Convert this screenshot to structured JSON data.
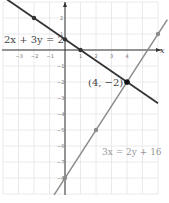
{
  "chart_data": {
    "type": "line",
    "title": "",
    "xlabel": "x",
    "ylabel": "y",
    "xlim": [
      -4,
      6
    ],
    "ylim": [
      -9,
      3
    ],
    "grid": true,
    "x_tick_labels": [
      "-3",
      "-2",
      "-1",
      "1",
      "2",
      "3",
      "4"
    ],
    "y_tick_labels": [
      "2",
      "1",
      "-1",
      "-2",
      "-3",
      "-4",
      "-5",
      "-6",
      "-7",
      "-8"
    ],
    "series": [
      {
        "name": "2x + 3y = 2",
        "color": "#333333",
        "points": [
          [
            -2,
            2
          ],
          [
            0,
            0.667
          ],
          [
            1,
            0
          ],
          [
            4,
            -2
          ]
        ],
        "line_extent": [
          [
            -4,
            3.333
          ],
          [
            6,
            -3.333
          ]
        ]
      },
      {
        "name": "3x = 2y + 16",
        "color": "#8c8c8c",
        "points": [
          [
            0,
            -8
          ],
          [
            2,
            -5
          ],
          [
            4,
            -2
          ],
          [
            6,
            1
          ]
        ],
        "line_extent": [
          [
            -0.7,
            -9.05
          ],
          [
            6.6,
            1.9
          ]
        ]
      }
    ],
    "annotations": [
      {
        "text": "2x + 3y = 2",
        "at": [
          -2.9,
          0.7
        ]
      },
      {
        "text": "(4, −2)",
        "at": [
          1.4,
          -2.1
        ]
      },
      {
        "text": "3x = 2y + 16",
        "at": [
          2.4,
          -6.6
        ]
      },
      {
        "text": "intersection",
        "point": [
          4,
          -2
        ]
      }
    ]
  },
  "labels": {
    "eq1": "2x + 3y = 2",
    "eq2": "3x = 2y + 16",
    "intersection": "(4, −2)",
    "x_axis": "x"
  }
}
